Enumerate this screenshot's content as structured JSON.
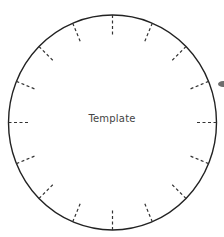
{
  "diagram": {
    "type": "circle-template",
    "label": "Template",
    "tick_count": 16,
    "tick_style": "dashed",
    "center": [
      112.5,
      122.5
    ],
    "radius_x": 104,
    "radius_y": 107.5,
    "tick_length": 22,
    "stroke_color": "#222222",
    "tick_color": "#333333"
  }
}
